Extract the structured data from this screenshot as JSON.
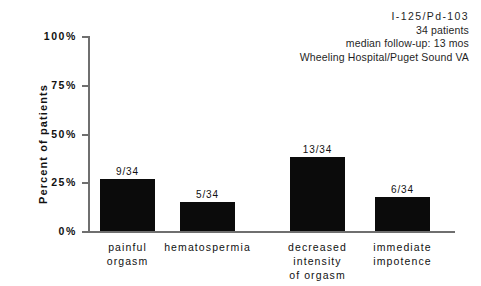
{
  "annotation": {
    "line1": "I-125/Pd-103",
    "line2": "34 patients",
    "line3": "median follow-up: 13 mos",
    "line4": "Wheeling Hospital/Puget Sound VA"
  },
  "axis": {
    "y_title": "Percent of patients",
    "ticks": [
      {
        "label": "100%",
        "value": 100
      },
      {
        "label": "75%",
        "value": 75
      },
      {
        "label": "50%",
        "value": 50
      },
      {
        "label": "25%",
        "value": 25
      },
      {
        "label": "0%",
        "value": 0
      }
    ]
  },
  "chart_data": {
    "type": "bar",
    "title": "",
    "subtitle": "I-125/Pd-103 — 34 patients, median follow-up: 13 mos, Wheeling Hospital/Puget Sound VA",
    "xlabel": "",
    "ylabel": "Percent of patients",
    "ylim": [
      0,
      100
    ],
    "ytick_labels": [
      "0%",
      "25%",
      "50%",
      "75%",
      "100%"
    ],
    "ytick_values": [
      0,
      25,
      50,
      75,
      100
    ],
    "grid": false,
    "legend": "none",
    "bar_color": "#0b0b0b",
    "categories": [
      "painful orgasm",
      "hematospermia",
      "decreased intensity of orgasm",
      "immediate impotence"
    ],
    "category_lines": [
      [
        "painful",
        "orgasm"
      ],
      [
        "hematospermia"
      ],
      [
        "decreased",
        "intensity",
        "of orgasm"
      ],
      [
        "immediate",
        "impotence"
      ]
    ],
    "values": [
      26.5,
      14.7,
      38.2,
      17.6
    ],
    "data_labels": [
      "9/34",
      "5/34",
      "13/34",
      "6/34"
    ],
    "numerators": [
      9,
      5,
      13,
      6
    ],
    "denominator": 34
  }
}
